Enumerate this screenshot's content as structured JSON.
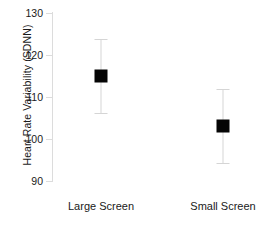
{
  "chart_data": {
    "type": "scatter",
    "title": "",
    "subtitle": "",
    "xlabel": "",
    "ylabel": "Heart Rate Variability (SDNN)",
    "categories": [
      "Large Screen",
      "Small Screen"
    ],
    "values": [
      115.0,
      103.0
    ],
    "error_low": [
      106.1,
      94.3
    ],
    "error_high": [
      123.8,
      111.9
    ],
    "series": [
      {
        "name": "Heart Rate Variability (SDNN)",
        "values": [
          115.0,
          103.0
        ],
        "error_low": [
          106.1,
          94.3
        ],
        "error_high": [
          123.8,
          111.9
        ]
      }
    ],
    "ylim": [
      90,
      130
    ],
    "yticks": [
      90,
      100,
      110,
      120,
      130
    ],
    "ytick_labels": [
      "90",
      "100",
      "110",
      "120",
      "130"
    ],
    "grid": false,
    "legend": false,
    "legend_position": "none",
    "marker": "square",
    "marker_color": "#050505",
    "errorbar_color": "#d5d5d5",
    "axis_color": "#dcdcdc",
    "background_color": "#ffffff",
    "annotations": []
  },
  "axes": {
    "y": {
      "ticks": [
        {
          "label": "130",
          "value": 130
        },
        {
          "label": "120",
          "value": 120
        },
        {
          "label": "110",
          "value": 110
        },
        {
          "label": "100",
          "value": 100
        },
        {
          "label": "90",
          "value": 90
        }
      ]
    },
    "x": {
      "categories": [
        {
          "label": "Large Screen"
        },
        {
          "label": "Small Screen"
        }
      ]
    }
  }
}
